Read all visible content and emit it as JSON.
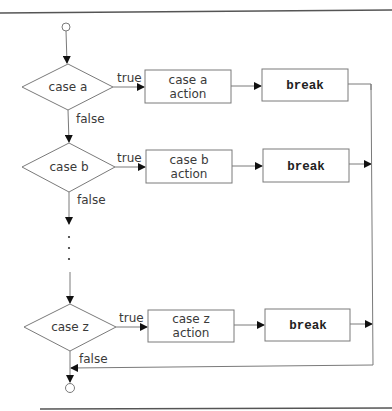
{
  "diagram": {
    "type": "switch-statement flowchart",
    "colors": {
      "stroke": "#7a7a7a",
      "arrowhead": "#111111",
      "text": "#3a3a3a",
      "border": "#555555",
      "background": "#ffffff"
    },
    "start_node": {
      "shape": "circle",
      "label": ""
    },
    "end_node": {
      "shape": "circle",
      "label": ""
    },
    "cases": [
      {
        "decision": "case a",
        "true_label": "true",
        "false_label": "false",
        "action_line1": "case a",
        "action_line2": "action",
        "break_label": "break"
      },
      {
        "decision": "case b",
        "true_label": "true",
        "false_label": "false",
        "action_line1": "case b",
        "action_line2": "action",
        "break_label": "break"
      },
      {
        "decision": "case z",
        "true_label": "true",
        "false_label": "false",
        "action_line1": "case z",
        "action_line2": "action",
        "break_label": "break"
      }
    ],
    "ellipsis": "⋮"
  }
}
